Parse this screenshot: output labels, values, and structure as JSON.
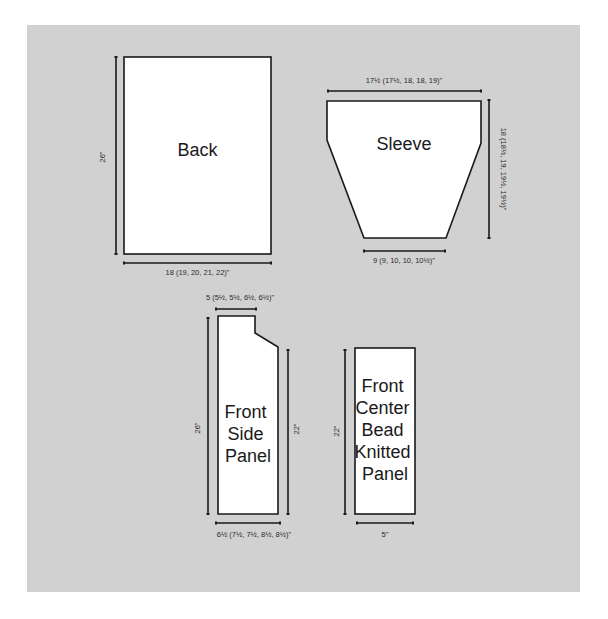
{
  "diagram": {
    "type": "knitting-schematic",
    "colors": {
      "background": "#d1d1d1",
      "piece_fill": "#ffffff",
      "line": "#1a1a1a"
    },
    "pieces": {
      "back": {
        "label": "Back",
        "height_label": "26\"",
        "width_label": "18 (19, 20, 21, 22)\""
      },
      "sleeve": {
        "label": "Sleeve",
        "top_width_label": "17½ (17½, 18, 18, 19)\"",
        "bottom_width_label": "9 (9, 10, 10, 10½)\"",
        "length_label": "18 (18½, 19, 19½, 19½)\""
      },
      "front_side_panel": {
        "label_lines": [
          "Front",
          "Side",
          "Panel"
        ],
        "shoulder_width_label": "5 (5½, 5½, 6½, 6½)\"",
        "full_height_label": "26\"",
        "side_height_label": "22\"",
        "bottom_width_label": "6½ (7½, 7½, 8½, 8½)\""
      },
      "front_center_panel": {
        "label_lines": [
          "Front",
          "Center",
          "Bead",
          "Knitted",
          "Panel"
        ],
        "height_label": "22\"",
        "width_label": "5\""
      }
    }
  }
}
